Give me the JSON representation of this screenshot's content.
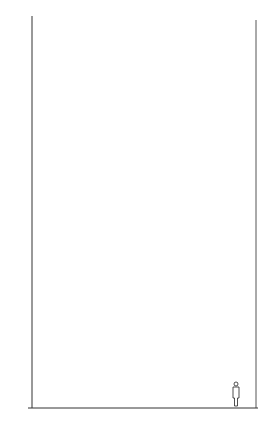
{
  "figure": {
    "unit_label": "m",
    "y_axis": {
      "ticks": [
        2,
        4,
        6,
        8,
        10,
        12,
        14,
        16,
        18,
        20,
        22,
        24,
        26,
        28
      ],
      "range": [
        0,
        28
      ]
    },
    "trees": [
      {
        "label": "17 y",
        "height_m": 7.5,
        "style": "dense-dark"
      },
      {
        "label": "80 y",
        "height_m": 27,
        "style": "open-outline"
      }
    ],
    "colors": {
      "ink": "#111111",
      "background": "#ffffff"
    }
  }
}
